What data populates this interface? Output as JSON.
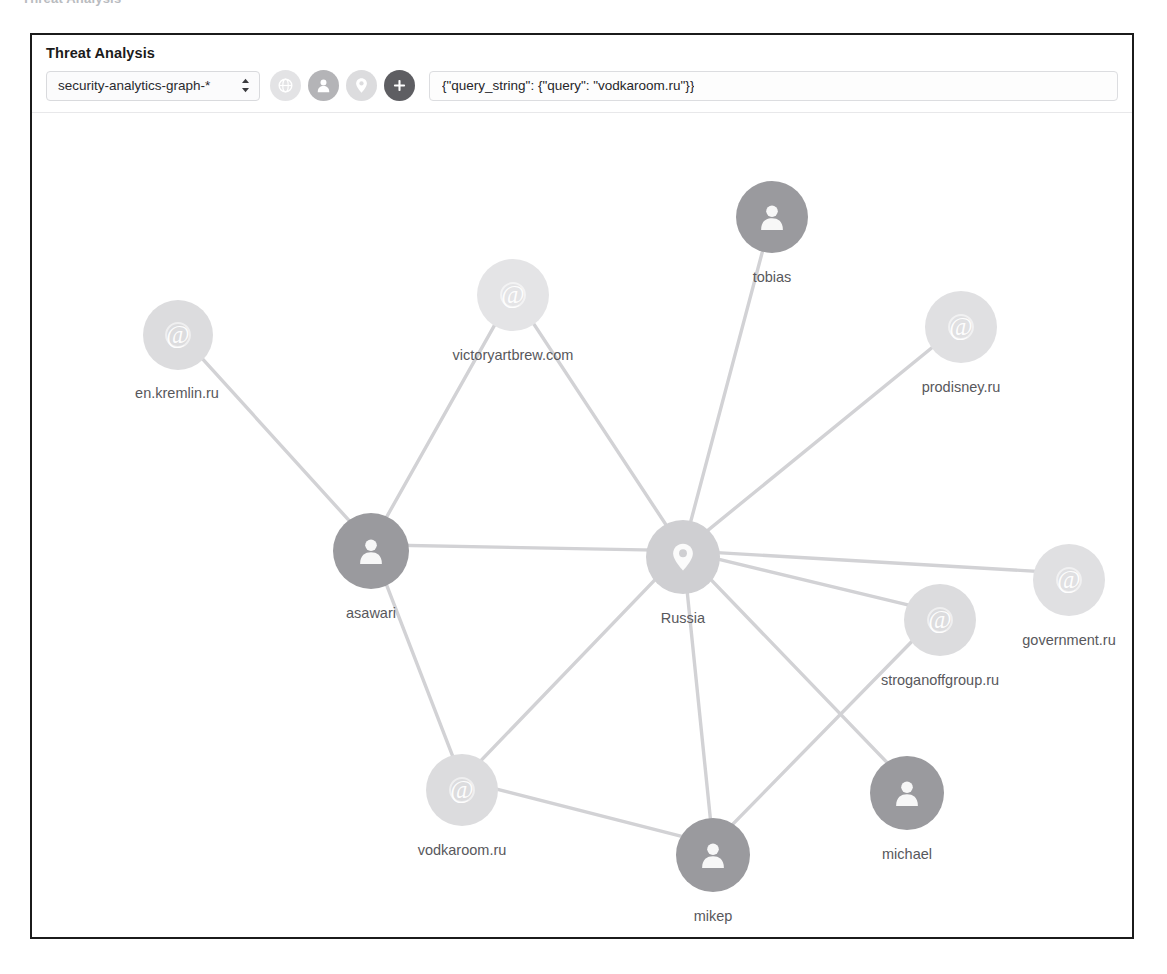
{
  "top_sliver_text": "Threat Analysis",
  "panel": {
    "title": "Threat Analysis"
  },
  "toolbar": {
    "index_select": {
      "value": "security-analytics-graph-*",
      "icon": "spinner-up-down-icon"
    },
    "icon_buttons": [
      {
        "name": "network-icon",
        "glyph": "globe",
        "color": "#e3e3e5",
        "active": false
      },
      {
        "name": "person-icon",
        "glyph": "person",
        "color": "#b4b4b7",
        "active": true
      },
      {
        "name": "location-icon",
        "glyph": "pin",
        "color": "#dcdcde",
        "active": false
      },
      {
        "name": "add-icon",
        "glyph": "plus",
        "color": "#5e5e62",
        "active": true
      }
    ],
    "query": {
      "value": "{\"query_string\": {\"query\": \"vodkaroom.ru\"}}",
      "placeholder": "Enter a query"
    }
  },
  "colors": {
    "node_person_dark": "#9a9a9e",
    "node_person_mid": "#aeaeb2",
    "node_domain_light": "#dcdcde",
    "node_domain_lighter": "#e4e4e6",
    "node_location": "#cfcfd2",
    "edge": "#d2d2d5",
    "label": "#58585c",
    "border": "#1b1b1b"
  },
  "chart_data": {
    "type": "graph",
    "title": "Threat Analysis",
    "node_types": {
      "domain": "@-icon",
      "person": "person-icon",
      "location": "pin-icon"
    },
    "nodes": [
      {
        "id": "en.kremlin.ru",
        "label": "en.kremlin.ru",
        "type": "domain",
        "x": 146,
        "y": 222,
        "r": 35,
        "fill": "#dcdcde",
        "label_dx": -1,
        "label_dy": 50
      },
      {
        "id": "victoryartbrew.com",
        "label": "victoryartbrew.com",
        "type": "domain",
        "x": 481,
        "y": 182,
        "r": 36,
        "fill": "#e4e4e6",
        "label_dx": 0,
        "label_dy": 52
      },
      {
        "id": "tobias",
        "label": "tobias",
        "type": "person",
        "x": 740,
        "y": 104,
        "r": 36,
        "fill": "#9a9a9e",
        "label_dx": 0,
        "label_dy": 52
      },
      {
        "id": "prodisney.ru",
        "label": "prodisney.ru",
        "type": "domain",
        "x": 929,
        "y": 214,
        "r": 36,
        "fill": "#e0e0e2",
        "label_dx": 0,
        "label_dy": 52
      },
      {
        "id": "asawari",
        "label": "asawari",
        "type": "person",
        "x": 339,
        "y": 438,
        "r": 38,
        "fill": "#9a9a9e",
        "label_dx": 0,
        "label_dy": 54
      },
      {
        "id": "Russia",
        "label": "Russia",
        "type": "location",
        "x": 651,
        "y": 444,
        "r": 37,
        "fill": "#cfcfd2",
        "label_dx": 0,
        "label_dy": 53
      },
      {
        "id": "government.ru",
        "label": "government.ru",
        "type": "domain",
        "x": 1037,
        "y": 467,
        "r": 36,
        "fill": "#e0e0e2",
        "label_dx": 0,
        "label_dy": 52
      },
      {
        "id": "stroganoffgroup.ru",
        "label": "stroganoffgroup.ru",
        "type": "domain",
        "x": 908,
        "y": 507,
        "r": 36,
        "fill": "#dcdcde",
        "label_dx": 0,
        "label_dy": 52
      },
      {
        "id": "vodkaroom.ru",
        "label": "vodkaroom.ru",
        "type": "domain",
        "x": 430,
        "y": 677,
        "r": 36,
        "fill": "#dcdcde",
        "label_dx": 0,
        "label_dy": 52
      },
      {
        "id": "mikep",
        "label": "mikep",
        "type": "person",
        "x": 681,
        "y": 742,
        "r": 37,
        "fill": "#9a9a9e",
        "label_dx": 0,
        "label_dy": 53
      },
      {
        "id": "michael",
        "label": "michael",
        "type": "person",
        "x": 875,
        "y": 680,
        "r": 37,
        "fill": "#9a9a9e",
        "label_dx": 0,
        "label_dy": 53
      }
    ],
    "edges": [
      {
        "source": "en.kremlin.ru",
        "target": "asawari"
      },
      {
        "source": "victoryartbrew.com",
        "target": "asawari"
      },
      {
        "source": "victoryartbrew.com",
        "target": "Russia"
      },
      {
        "source": "tobias",
        "target": "Russia"
      },
      {
        "source": "prodisney.ru",
        "target": "Russia"
      },
      {
        "source": "asawari",
        "target": "Russia"
      },
      {
        "source": "asawari",
        "target": "vodkaroom.ru"
      },
      {
        "source": "Russia",
        "target": "government.ru"
      },
      {
        "source": "Russia",
        "target": "stroganoffgroup.ru"
      },
      {
        "source": "Russia",
        "target": "vodkaroom.ru"
      },
      {
        "source": "Russia",
        "target": "mikep"
      },
      {
        "source": "Russia",
        "target": "michael"
      },
      {
        "source": "vodkaroom.ru",
        "target": "mikep"
      },
      {
        "source": "stroganoffgroup.ru",
        "target": "mikep"
      }
    ]
  }
}
